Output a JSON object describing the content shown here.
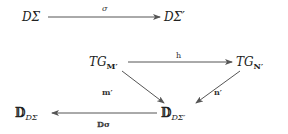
{
  "diagram_top": {
    "source_node": {
      "main": "DΣ"
    },
    "target_node": {
      "main": "DΣ′"
    },
    "arrow_label": "σ"
  },
  "diagram_bottom": {
    "tg_m": {
      "main": "TG",
      "sub": "M′"
    },
    "tg_n": {
      "main": "TG",
      "sub": "N′"
    },
    "d_dsigma": {
      "main": "𝔻",
      "sub": "DΣ"
    },
    "d_dsigma_prime": {
      "main": "𝔻",
      "sub": "DΣ′"
    },
    "arrow_h_label": "h",
    "arrow_m_label": "m′",
    "arrow_n_label": "n′",
    "arrow_dsigma_label": "𝔻σ"
  },
  "colors": {
    "stroke": "#555555",
    "text": "#222222",
    "background": "#ffffff"
  }
}
